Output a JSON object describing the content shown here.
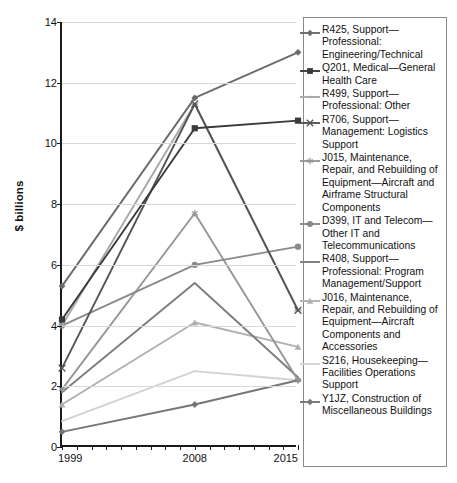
{
  "chart_data": {
    "type": "line",
    "title": "",
    "xlabel": "",
    "ylabel": "$ billions",
    "x": [
      1999,
      2008,
      2015
    ],
    "xtick_labels": [
      "1999",
      "2008",
      "2015"
    ],
    "ytick_labels": [
      "0",
      "2",
      "4",
      "6",
      "8",
      "10",
      "12",
      "14"
    ],
    "ytick_values": [
      0,
      2,
      4,
      6,
      8,
      10,
      12,
      14
    ],
    "ylim": [
      0,
      14
    ],
    "xlim": [
      1999,
      2015
    ],
    "grid": "horizontal",
    "legend_position": "right",
    "series": [
      {
        "name": "R425, Support—Professional: Engineering/Technical",
        "marker": "diamond",
        "color": "#6b6b6b",
        "values": [
          5.3,
          11.5,
          13.0
        ]
      },
      {
        "name": "Q201, Medical—General Health Care",
        "marker": "square",
        "color": "#3a3a3a",
        "values": [
          4.2,
          10.5,
          10.75
        ]
      },
      {
        "name": "R499, Support—Professional: Other",
        "marker": "dash",
        "color": "#a8a8a8",
        "values": [
          4.0,
          11.3,
          4.5
        ]
      },
      {
        "name": "R706, Support—Management: Logistics Support",
        "marker": "x",
        "color": "#555555",
        "values": [
          2.6,
          11.3,
          4.5
        ]
      },
      {
        "name": "J015, Maintenance, Repair, and Rebuilding of Equipment—Aircraft and Airframe Structural Components",
        "marker": "asterisk",
        "color": "#969696",
        "values": [
          1.9,
          7.7,
          2.2
        ]
      },
      {
        "name": "D399, IT and Telecom—Other IT and Telecommunications",
        "marker": "circle",
        "color": "#8a8a8a",
        "values": [
          4.0,
          6.0,
          6.6
        ]
      },
      {
        "name": "R408, Support—Professional: Program Management/Support",
        "marker": "line",
        "color": "#7d7d7d",
        "values": [
          1.8,
          5.4,
          2.3
        ]
      },
      {
        "name": "J016, Maintenance, Repair, and Rebuilding of Equipment—Aircraft Components and Accessories",
        "marker": "triangle",
        "color": "#b0b0b0",
        "values": [
          1.4,
          4.1,
          3.3
        ]
      },
      {
        "name": "S216, Housekeeping—Facilities Operations Support",
        "marker": "line",
        "color": "#d2d2d2",
        "values": [
          0.85,
          2.5,
          2.2
        ]
      },
      {
        "name": "Y1JZ, Construction of Miscellaneous Buildings",
        "marker": "diamond",
        "color": "#767676",
        "values": [
          0.5,
          1.4,
          2.2
        ]
      }
    ]
  },
  "axis": {
    "y_title": "$ billions"
  }
}
